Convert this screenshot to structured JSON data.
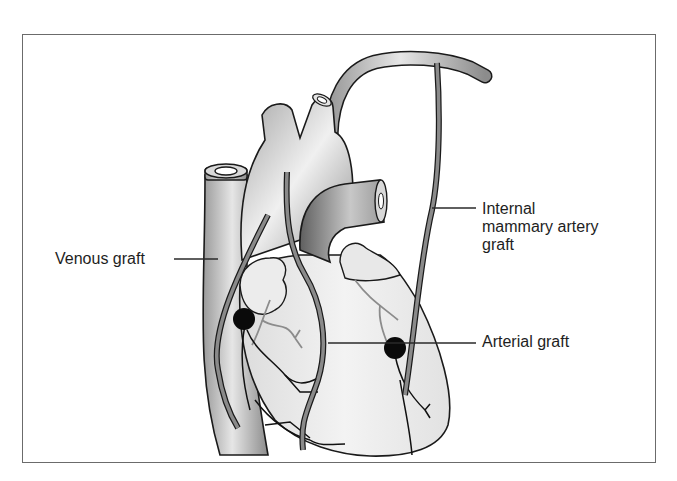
{
  "figure": {
    "type": "anatomical illustration",
    "colors": {
      "frame": "#6b6b6b",
      "vessel_fill": "#c9c9c9",
      "outline": "#1a1a1a",
      "graft": "#8a8a8a",
      "anastomosis_dot": "#0a0a0a",
      "label_text": "#1e1e1e"
    }
  },
  "labels": {
    "venous_graft": "Venous graft",
    "internal_mammary": {
      "line1": "Internal",
      "line2": "mammary artery",
      "line3": "graft"
    },
    "arterial_graft": "Arterial graft"
  }
}
